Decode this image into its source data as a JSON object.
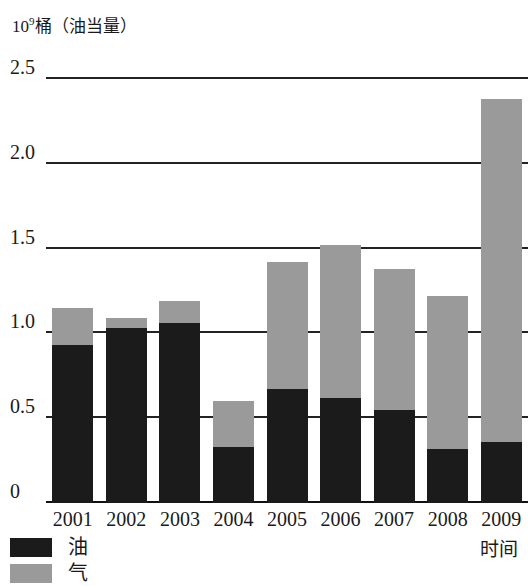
{
  "chart_data": {
    "type": "bar",
    "subtype": "stacked-vertical",
    "title": "",
    "ylabel": "10⁹桶（油当量）",
    "ylabel_mantissa": "10",
    "ylabel_exponent": "9",
    "ylabel_rest": "桶（油当量）",
    "xlabel": "时间",
    "categories": [
      "2001",
      "2002",
      "2003",
      "2004",
      "2005",
      "2006",
      "2007",
      "2008",
      "2009"
    ],
    "series": [
      {
        "name": "油",
        "color": "#1b1b1b",
        "values": [
          0.93,
          1.03,
          1.06,
          0.33,
          0.67,
          0.62,
          0.55,
          0.32,
          0.36
        ]
      },
      {
        "name": "气",
        "color": "#9a9a9a",
        "values": [
          0.22,
          0.06,
          0.13,
          0.27,
          0.75,
          0.9,
          0.83,
          0.9,
          2.02
        ]
      }
    ],
    "totals": [
      1.15,
      1.09,
      1.19,
      0.6,
      1.42,
      1.52,
      1.38,
      1.22,
      2.38
    ],
    "ylim": [
      0,
      2.5
    ],
    "yticks": [
      0,
      0.5,
      1.0,
      1.5,
      2.0,
      2.5
    ],
    "ytick_labels": [
      "0",
      "0.5",
      "1.0",
      "1.5",
      "2.0",
      "2.5"
    ],
    "grid": true,
    "grid_axis": "y",
    "legend_position": "bottom-left"
  },
  "legend": {
    "items": [
      {
        "label": "油",
        "color": "#1b1b1b"
      },
      {
        "label": "气",
        "color": "#9a9a9a"
      }
    ]
  }
}
